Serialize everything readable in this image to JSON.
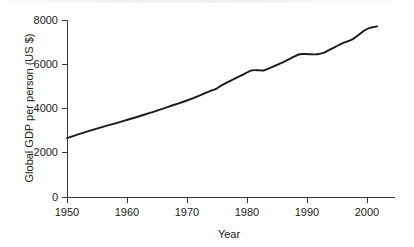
{
  "chart_data": {
    "type": "line",
    "title": "",
    "xlabel": "Year",
    "ylabel": "Global GDP per person (US $)",
    "xlim": [
      1950,
      2005
    ],
    "ylim": [
      0,
      8000
    ],
    "grid": false,
    "legend": false,
    "x_ticks": [
      1950,
      1960,
      1970,
      1980,
      1990,
      2000
    ],
    "x_tick_labels": [
      "1950",
      "1960",
      "1970",
      "1980",
      "1990",
      "2000"
    ],
    "y_ticks": [
      0,
      2000,
      4000,
      6000,
      8000
    ],
    "y_tick_labels": [
      "0",
      "2000",
      "4000",
      "6000",
      "8000"
    ],
    "series": [
      {
        "name": "Global GDP per person",
        "color": "#1a1a1a",
        "x": [
          1950,
          1952,
          1954,
          1956,
          1958,
          1960,
          1962,
          1964,
          1966,
          1968,
          1970,
          1972,
          1974,
          1975,
          1976,
          1978,
          1980,
          1981,
          1982,
          1983,
          1984,
          1986,
          1988,
          1989,
          1990,
          1991,
          1992,
          1993,
          1994,
          1996,
          1998,
          2000,
          2001,
          2002
        ],
        "values": [
          2665,
          2840,
          3010,
          3170,
          3320,
          3480,
          3640,
          3810,
          3980,
          4170,
          4350,
          4560,
          4790,
          4890,
          5060,
          5330,
          5600,
          5720,
          5730,
          5720,
          5830,
          6060,
          6330,
          6450,
          6460,
          6450,
          6450,
          6510,
          6650,
          6920,
          7150,
          7550,
          7660,
          7710
        ]
      }
    ]
  },
  "axes": {
    "y_axis_label": "Global GDP per person (US $)",
    "x_axis_label": "Year"
  }
}
